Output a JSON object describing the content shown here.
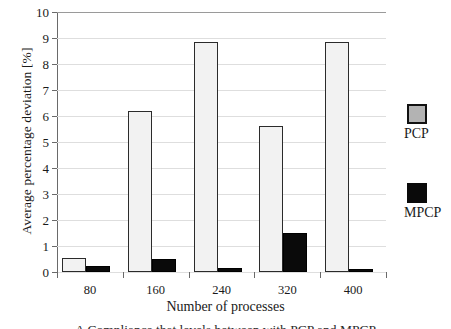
{
  "chart_data": {
    "type": "bar",
    "title": "",
    "xlabel": "Number of processes",
    "ylabel": "Average percentage deviation [%]",
    "categories": [
      "80",
      "160",
      "240",
      "320",
      "400"
    ],
    "series": [
      {
        "name": "PCP",
        "color": "#f2f2f2",
        "values": [
          0.55,
          6.2,
          8.85,
          5.6,
          8.85
        ]
      },
      {
        "name": "MPCP",
        "color": "#0a0a0a",
        "values": [
          0.25,
          0.5,
          0.15,
          1.5,
          0.1
        ]
      }
    ],
    "ylim": [
      0,
      10
    ],
    "yticks": [
      "0",
      "1",
      "2",
      "3",
      "4",
      "5",
      "6",
      "7",
      "8",
      "9",
      "10"
    ],
    "grid": true,
    "legend_position": "right-outside"
  },
  "legend": {
    "entries": [
      {
        "label": "PCP",
        "swatch": "gray-square-swatch"
      },
      {
        "label": "MPCP",
        "swatch": "black-square-swatch"
      }
    ]
  },
  "caption": {
    "text": "A Compliance that levels between with PCP and MPCP"
  }
}
